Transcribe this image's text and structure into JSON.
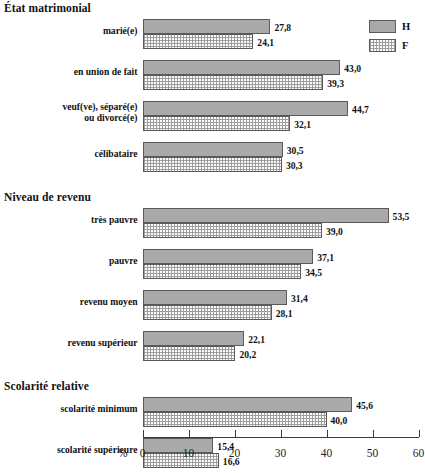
{
  "chart_data": {
    "type": "bar",
    "orientation": "horizontal",
    "title": "",
    "xlabel": "%",
    "ylabel": "",
    "xlim": [
      0,
      60
    ],
    "xticks": [
      0,
      10,
      20,
      30,
      40,
      50,
      60
    ],
    "grid": false,
    "legend_position": "top-right",
    "legend": [
      {
        "name": "H",
        "pattern": "solid-gray",
        "color": "#a9a9a9"
      },
      {
        "name": "F",
        "pattern": "dotted-checker",
        "color": "#fbfbfb"
      }
    ],
    "series": [
      {
        "name": "H",
        "values": [
          27.8,
          43.0,
          44.7,
          30.5,
          53.5,
          37.1,
          31.4,
          22.1,
          45.6,
          15.4
        ]
      },
      {
        "name": "F",
        "values": [
          24.1,
          39.3,
          32.1,
          30.3,
          39.0,
          34.5,
          28.1,
          20.2,
          40.0,
          16.6
        ]
      }
    ],
    "categories": [
      "marié(e)",
      "en union de fait",
      "veuf(ve), séparé(e) ou divorcé(e)",
      "célibataire",
      "très pauvre",
      "pauvre",
      "revenu moyen",
      "revenu supérieur",
      "scolarité minimum",
      "scolarité supérieure"
    ],
    "value_labels": {
      "H": [
        "27,8",
        "43,0",
        "44,7",
        "30,5",
        "53,5",
        "37,1",
        "31,4",
        "22,1",
        "45,6",
        "15,4"
      ],
      "F": [
        "24,1",
        "39,3",
        "32,1",
        "30,3",
        "39,0",
        "34,5",
        "28,1",
        "20,2",
        "40,0",
        "16,6"
      ]
    },
    "sections": [
      {
        "title": "État matrimonial",
        "groups": [
          {
            "label_lines": [
              "marié(e)"
            ],
            "h": 27.8,
            "f": 24.1,
            "h_label": "27,8",
            "f_label": "24,1"
          },
          {
            "label_lines": [
              "en union de fait"
            ],
            "h": 43.0,
            "f": 39.3,
            "h_label": "43,0",
            "f_label": "39,3"
          },
          {
            "label_lines": [
              "veuf(ve), séparé(e)",
              "ou divorcé(e)"
            ],
            "h": 44.7,
            "f": 32.1,
            "h_label": "44,7",
            "f_label": "32,1"
          },
          {
            "label_lines": [
              "célibataire"
            ],
            "h": 30.5,
            "f": 30.3,
            "h_label": "30,5",
            "f_label": "30,3"
          }
        ]
      },
      {
        "title": "Niveau de revenu",
        "groups": [
          {
            "label_lines": [
              "très pauvre"
            ],
            "h": 53.5,
            "f": 39.0,
            "h_label": "53,5",
            "f_label": "39,0"
          },
          {
            "label_lines": [
              "pauvre"
            ],
            "h": 37.1,
            "f": 34.5,
            "h_label": "37,1",
            "f_label": "34,5"
          },
          {
            "label_lines": [
              "revenu moyen"
            ],
            "h": 31.4,
            "f": 28.1,
            "h_label": "31,4",
            "f_label": "28,1"
          },
          {
            "label_lines": [
              "revenu supérieur"
            ],
            "h": 22.1,
            "f": 20.2,
            "h_label": "22,1",
            "f_label": "20,2"
          }
        ]
      },
      {
        "title": "Scolarité relative",
        "groups": [
          {
            "label_lines": [
              "scolarité minimum"
            ],
            "h": 45.6,
            "f": 40.0,
            "h_label": "45,6",
            "f_label": "40,0"
          },
          {
            "label_lines": [
              "scolarité supérieure"
            ],
            "h": 15.4,
            "f": 16.6,
            "h_label": "15,4",
            "f_label": "16,6"
          }
        ]
      }
    ],
    "axis": {
      "pct_symbol": "%",
      "tick_labels": [
        "0",
        "10",
        "20",
        "30",
        "40",
        "50",
        "60"
      ]
    }
  }
}
